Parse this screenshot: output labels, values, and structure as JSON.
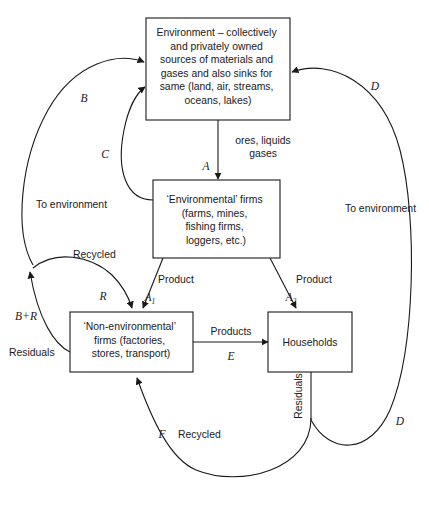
{
  "diagram": {
    "boxes": [
      {
        "id": "environment",
        "lines": [
          "Environment – collectively",
          "and privately owned",
          "sources of materials and",
          "gases and also sinks for",
          "same (land, air, streams,",
          "oceans, lakes)"
        ]
      },
      {
        "id": "environmental-firms",
        "lines": [
          "‘Environmental’ firms",
          "(farms, mines,",
          "fishing firms,",
          "loggers, etc.)"
        ]
      },
      {
        "id": "non-environmental-firms",
        "lines": [
          "‘Non-environmental’",
          "firms (factories,",
          "stores, transport)"
        ]
      },
      {
        "id": "households",
        "lines": [
          "Households"
        ]
      }
    ],
    "flow_labels": {
      "ores_liquids": "ores, liquids",
      "gases": "gases",
      "to_environment_left": "To environment",
      "to_environment_right": "To environment",
      "recycled_left": "Recycled",
      "recycled_bottom": "Recycled",
      "residuals_left": "Residuals",
      "residuals_right": "Residuals",
      "product_left": "Product",
      "product_right": "Product",
      "products_middle": "Products"
    },
    "symbols": {
      "a": "A",
      "a1_base": "A",
      "a1_sub": "1",
      "a2_base": "A",
      "a2_sub": "2",
      "b": "B",
      "c": "C",
      "d_top": "D",
      "d_bottom": "D",
      "e": "E",
      "f": "F",
      "r": "R",
      "b_plus_r": "B+R"
    },
    "colors": {
      "stroke": "#1a1a1a",
      "background": "#ffffff",
      "text": "#1a1a1a"
    }
  }
}
